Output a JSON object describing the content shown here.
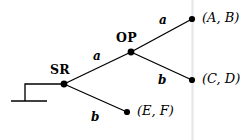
{
  "diagram": {
    "background_color": "#ffffff",
    "ink_color": "#000000",
    "artifact_line_color": "#e4e4e4",
    "nodes": [
      {
        "id": "root",
        "label": "SR",
        "x": 64,
        "y": 84,
        "label_x": 50,
        "label_y": 64,
        "type": "decision"
      },
      {
        "id": "op",
        "label": "OP",
        "x": 131,
        "y": 52,
        "label_x": 116,
        "label_y": 32,
        "type": "decision"
      },
      {
        "id": "ab",
        "label": "(A, B)",
        "x": 192,
        "y": 19,
        "label_x": 202,
        "label_y": 11,
        "type": "terminal"
      },
      {
        "id": "cd",
        "label": "(C, D)",
        "x": 192,
        "y": 80,
        "label_x": 202,
        "label_y": 72,
        "type": "terminal"
      },
      {
        "id": "ef",
        "label": "(E, F)",
        "x": 127,
        "y": 112,
        "label_x": 137,
        "label_y": 104,
        "type": "terminal"
      }
    ],
    "edges": [
      {
        "id": "root-op",
        "from": "root",
        "to": "op",
        "label": "a",
        "label_x": 93,
        "label_y": 50
      },
      {
        "id": "root-ef",
        "from": "root",
        "to": "ef",
        "label": "b",
        "label_x": 91,
        "label_y": 111
      },
      {
        "id": "op-ab",
        "from": "op",
        "to": "ab",
        "label": "a",
        "label_x": 159,
        "label_y": 14
      },
      {
        "id": "op-cd",
        "from": "op",
        "to": "cd",
        "label": "b",
        "label_x": 158,
        "label_y": 74
      }
    ],
    "ground_symbol": {
      "name": "ground-symbol",
      "stem_from_x": 64,
      "stem_from_y": 84,
      "stem_to_x": 25,
      "stem_to_y": 84,
      "drop_to_y": 101,
      "bar_x1": 11,
      "bar_x2": 47,
      "bar_y": 101
    },
    "artifact": {
      "name": "scan-line",
      "x": 192.5,
      "y1": 0,
      "y2": 140
    },
    "node_radius": 3.1,
    "stroke_width": 1.35
  }
}
